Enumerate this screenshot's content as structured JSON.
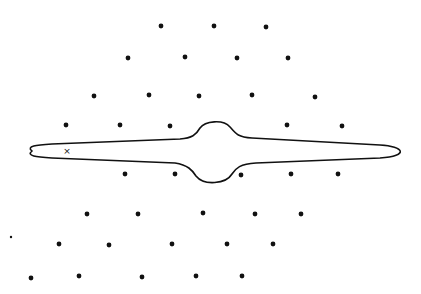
{
  "diagram": {
    "width": 421,
    "height": 294,
    "background": "#ffffff",
    "ink_color": "#111111",
    "dot_radius": 2.4,
    "dots": [
      {
        "x": 161,
        "y": 26
      },
      {
        "x": 214,
        "y": 26
      },
      {
        "x": 266,
        "y": 27
      },
      {
        "x": 128,
        "y": 58
      },
      {
        "x": 185,
        "y": 57
      },
      {
        "x": 237,
        "y": 58
      },
      {
        "x": 288,
        "y": 58
      },
      {
        "x": 94,
        "y": 96
      },
      {
        "x": 149,
        "y": 95
      },
      {
        "x": 199,
        "y": 96
      },
      {
        "x": 252,
        "y": 95
      },
      {
        "x": 315,
        "y": 97
      },
      {
        "x": 66,
        "y": 125
      },
      {
        "x": 120,
        "y": 125
      },
      {
        "x": 170,
        "y": 126
      },
      {
        "x": 287,
        "y": 125
      },
      {
        "x": 342,
        "y": 126
      },
      {
        "x": 125,
        "y": 174
      },
      {
        "x": 175,
        "y": 174
      },
      {
        "x": 241,
        "y": 175
      },
      {
        "x": 291,
        "y": 174
      },
      {
        "x": 338,
        "y": 174
      },
      {
        "x": 87,
        "y": 214
      },
      {
        "x": 138,
        "y": 214
      },
      {
        "x": 203,
        "y": 213
      },
      {
        "x": 255,
        "y": 214
      },
      {
        "x": 301,
        "y": 214
      },
      {
        "x": 59,
        "y": 244
      },
      {
        "x": 109,
        "y": 245
      },
      {
        "x": 172,
        "y": 244
      },
      {
        "x": 227,
        "y": 244
      },
      {
        "x": 273,
        "y": 244
      },
      {
        "x": 31,
        "y": 278
      },
      {
        "x": 79,
        "y": 276
      },
      {
        "x": 142,
        "y": 277
      },
      {
        "x": 196,
        "y": 276
      },
      {
        "x": 242,
        "y": 276
      }
    ],
    "small_dots": [
      {
        "x": 11,
        "y": 237,
        "r": 1.2
      }
    ],
    "cross_marker": {
      "x": 67,
      "y": 151,
      "label": "×"
    },
    "contour": {
      "description": "closed elongated curve with central bulge",
      "path": "M 32 151 C 26 146 36 145 52 144 L 180 139 C 192 138 196 135 200 128 C 205 121 223 119 230 127 C 236 134 238 137 252 138 L 380 145 C 404 146 410 156 380 158 L 256 163 C 240 164 236 168 232 174 C 226 184 204 186 196 176 C 192 170 188 165 175 163 L 52 158 C 36 157 26 156 32 151 Z"
    }
  }
}
